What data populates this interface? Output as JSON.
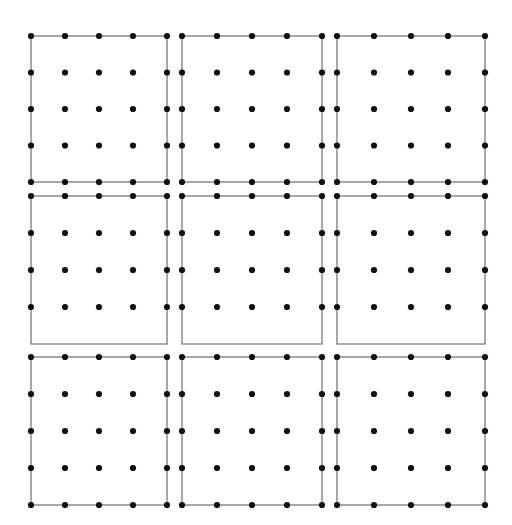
{
  "figure": {
    "title": "",
    "background_color": "#ffffff",
    "width": 512,
    "height": 525
  },
  "chart_data": {
    "type": "scatter",
    "title": "",
    "subtitle": "",
    "xlabel": "",
    "ylabel": "",
    "xlim": [
      0,
      512
    ],
    "ylim": [
      0,
      525
    ],
    "grid": false,
    "legend": null,
    "panel_grid": {
      "rows": 3,
      "cols": 3
    },
    "lattice": {
      "rows": 5,
      "cols": 5,
      "dot_count_per_panel": 25
    },
    "style": {
      "dot_color": "#111111",
      "dot_radius_px": 3.1,
      "border_color": "#6f6f6f",
      "border_width_px": 1.2,
      "edge_color": "#6f6f6f",
      "edge_width_px": 1.2
    },
    "panels": [
      {
        "index": 0,
        "row": 0,
        "col": 0,
        "label": "panel-r0-c0",
        "x0": 31,
        "y0": 36,
        "x1": 167,
        "y1": 182,
        "bottom_edge_has_dots": true,
        "x_values": [
          31,
          65,
          99,
          133,
          167
        ],
        "y_values": [
          36,
          72.5,
          109,
          145.5,
          182
        ]
      },
      {
        "index": 1,
        "row": 0,
        "col": 1,
        "label": "panel-r0-c1",
        "x0": 182,
        "y0": 36,
        "x1": 322,
        "y1": 182,
        "bottom_edge_has_dots": true,
        "x_values": [
          182,
          217,
          252,
          287,
          322
        ],
        "y_values": [
          36,
          72.5,
          109,
          145.5,
          182
        ]
      },
      {
        "index": 2,
        "row": 0,
        "col": 2,
        "label": "panel-r0-c2",
        "x0": 337,
        "y0": 36,
        "x1": 485,
        "y1": 182,
        "bottom_edge_has_dots": true,
        "x_values": [
          337,
          374,
          411,
          448,
          485
        ],
        "y_values": [
          36,
          72.5,
          109,
          145.5,
          182
        ]
      },
      {
        "index": 3,
        "row": 1,
        "col": 0,
        "label": "panel-r1-c0",
        "x0": 31,
        "y0": 196,
        "x1": 167,
        "y1": 344,
        "bottom_edge_has_dots": false,
        "x_values": [
          31,
          65,
          99,
          133,
          167
        ],
        "y_values": [
          196,
          233,
          270,
          307,
          344
        ]
      },
      {
        "index": 4,
        "row": 1,
        "col": 1,
        "label": "panel-r1-c1",
        "x0": 182,
        "y0": 196,
        "x1": 322,
        "y1": 344,
        "bottom_edge_has_dots": false,
        "x_values": [
          182,
          217,
          252,
          287,
          322
        ],
        "y_values": [
          196,
          233,
          270,
          307,
          344
        ]
      },
      {
        "index": 5,
        "row": 1,
        "col": 2,
        "label": "panel-r1-c2",
        "x0": 337,
        "y0": 196,
        "x1": 485,
        "y1": 344,
        "bottom_edge_has_dots": false,
        "x_values": [
          337,
          374,
          411,
          448,
          485
        ],
        "y_values": [
          196,
          233,
          270,
          307,
          344
        ]
      },
      {
        "index": 6,
        "row": 2,
        "col": 0,
        "label": "panel-r2-c0",
        "x0": 31,
        "y0": 357,
        "x1": 167,
        "y1": 505,
        "bottom_edge_has_dots": true,
        "x_values": [
          31,
          65,
          99,
          133,
          167
        ],
        "y_values": [
          357,
          394,
          431,
          468,
          505
        ]
      },
      {
        "index": 7,
        "row": 2,
        "col": 1,
        "label": "panel-r2-c1",
        "x0": 182,
        "y0": 357,
        "x1": 322,
        "y1": 505,
        "bottom_edge_has_dots": true,
        "x_values": [
          182,
          217,
          252,
          287,
          322
        ],
        "y_values": [
          357,
          394,
          431,
          468,
          505
        ]
      },
      {
        "index": 8,
        "row": 2,
        "col": 2,
        "label": "panel-r2-c2",
        "x0": 337,
        "y0": 357,
        "x1": 485,
        "y1": 505,
        "bottom_edge_has_dots": true,
        "x_values": [
          337,
          374,
          411,
          448,
          485
        ],
        "y_values": [
          357,
          394,
          431,
          468,
          505
        ]
      }
    ]
  }
}
